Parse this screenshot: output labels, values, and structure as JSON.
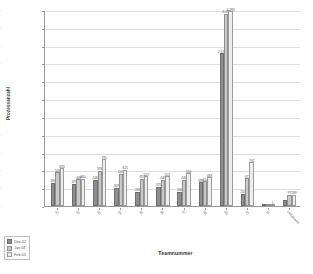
{
  "chart_data": {
    "type": "bar",
    "title": "",
    "xlabel": "Teamnummer",
    "ylabel": "Prozessanzahl",
    "ylim": [
      0,
      3300
    ],
    "ytick_values": [
      0,
      300,
      600,
      900,
      1200,
      1500,
      1800,
      2100,
      2400,
      2700,
      3000,
      3300
    ],
    "ytick_labels": [
      "0",
      "300",
      "600",
      "900",
      "1.200",
      "1.500",
      "1.800",
      "2.100",
      "2.400",
      "2.700",
      "3.000",
      "3.300"
    ],
    "grid": true,
    "legend_position": "bottom-left",
    "categories": [
      "01",
      "02",
      "03",
      "04",
      "05",
      "06",
      "07",
      "08",
      "09",
      "10",
      "11",
      "Unbekannt"
    ],
    "series": [
      {
        "name": "Dez 02",
        "color": "#8e8e8e",
        "values": [
          394,
          375,
          446,
          309,
          243,
          325,
          244,
          398,
          2578,
          210,
          0,
          97
        ]
      },
      {
        "name": "Jan 03",
        "color": "#c9c9c9",
        "values": [
          566,
          448,
          593,
          541,
          457,
          440,
          446,
          414,
          3240,
          473,
          0,
          189
        ]
      },
      {
        "name": "Feb 03",
        "color": "#eeeeee",
        "values": [
          633,
          460,
          791,
          611,
          502,
          501,
          554,
          483,
          3283,
          742,
          1,
          189
        ]
      }
    ],
    "bar_labels": [
      [
        "394",
        "566",
        "633"
      ],
      [
        "375",
        "448",
        "460"
      ],
      [
        "446",
        "593",
        "791"
      ],
      [
        "309",
        "541",
        "611"
      ],
      [
        "243",
        "457",
        "502"
      ],
      [
        "325",
        "440",
        "501"
      ],
      [
        "244",
        "446",
        "554"
      ],
      [
        "398",
        "414",
        "483"
      ],
      [
        "2.578",
        "3.240",
        "3.283"
      ],
      [
        "210",
        "473",
        "742"
      ],
      [
        "",
        "",
        "1"
      ],
      [
        "",
        "97",
        "189"
      ]
    ]
  },
  "legend": {
    "items": [
      {
        "label": "Dez 02"
      },
      {
        "label": "Jan 03"
      },
      {
        "label": "Feb 03"
      }
    ]
  }
}
